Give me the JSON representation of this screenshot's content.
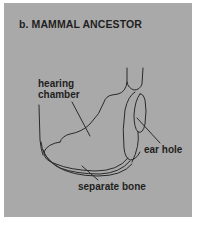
{
  "figure": {
    "title": "b. MAMMAL ANCESTOR",
    "labels": {
      "hearing_chamber_line1": "hearing",
      "hearing_chamber_line2": "chamber",
      "ear_hole": "ear hole",
      "separate_bone": "separate bone"
    },
    "colors": {
      "panel_background": "#a9a9a9",
      "line_color": "#2a2a2a",
      "text_color": "#1f1f1f",
      "page_background": "#ffffff"
    }
  }
}
